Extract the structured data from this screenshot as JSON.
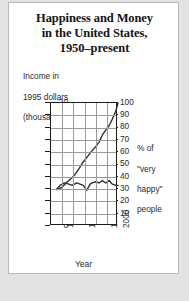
{
  "chart_data": {
    "type": "line",
    "title": "Happiness and Money\nin the United States,\n1950–present",
    "title_lines": [
      "Happiness and Money",
      "in the United States,",
      "1950–present"
    ],
    "xlabel": "Year",
    "ylabel_left": "Income in\n1995 dollars\n(thousands)",
    "ylabel_left_lines": [
      "Income in",
      "1995 dollars",
      "(thousands)"
    ],
    "ylabel_right": "% of\n\"very\nhappy\"\npeople",
    "ylabel_right_lines": [
      "% of",
      "\"very",
      "happy\"",
      "people"
    ],
    "xlim": [
      1940,
      2000
    ],
    "xticks": [
      1950,
      1970,
      1990,
      2000
    ],
    "xtick_labels": [
      "1950",
      "1970",
      "1990",
      "2000"
    ],
    "ylim_left": [
      0,
      20
    ],
    "yticks_left": [
      0,
      2,
      4,
      6,
      8,
      10,
      12,
      14,
      16,
      18,
      20
    ],
    "ytick_labels_left": [
      "0",
      "2",
      "4",
      "6",
      "8",
      "10",
      "12",
      "14",
      "16",
      "18",
      "20"
    ],
    "ylim_right": [
      0,
      100
    ],
    "yticks_right": [
      10,
      20,
      30,
      40,
      50,
      60,
      70,
      80,
      90,
      100
    ],
    "ytick_labels_right": [
      "10",
      "20",
      "30",
      "40",
      "50",
      "60",
      "70",
      "80",
      "90",
      "100"
    ],
    "grid": true,
    "grid_color": "#9a9a9a",
    "line_color": "#303030",
    "legend": "none",
    "series": [
      {
        "name": "Income in 1995 dollars (thousands)",
        "axis": "left",
        "x": [
          1945,
          1950,
          1953,
          1956,
          1959,
          1962,
          1965,
          1968,
          1971,
          1974,
          1977,
          1980,
          1983,
          1986,
          1989,
          1992,
          1995,
          1998,
          2000
        ],
        "values": [
          5.9,
          6.3,
          6.9,
          7.4,
          7.9,
          8.5,
          9.3,
          10.2,
          10.9,
          11.6,
          12.3,
          12.9,
          13.6,
          14.8,
          15.6,
          16.3,
          17.4,
          18.7,
          20.0
        ]
      },
      {
        "name": "% of \"very happy\" people",
        "axis": "right",
        "x": [
          1945,
          1948,
          1952,
          1956,
          1959,
          1963,
          1966,
          1969,
          1972,
          1975,
          1977,
          1980,
          1983,
          1986,
          1989,
          1992,
          1995,
          1998,
          2000
        ],
        "values": [
          30,
          33,
          35,
          34,
          33,
          35,
          34,
          33,
          29,
          34,
          35,
          36,
          35,
          37,
          35,
          37,
          34,
          33,
          33
        ]
      }
    ]
  }
}
